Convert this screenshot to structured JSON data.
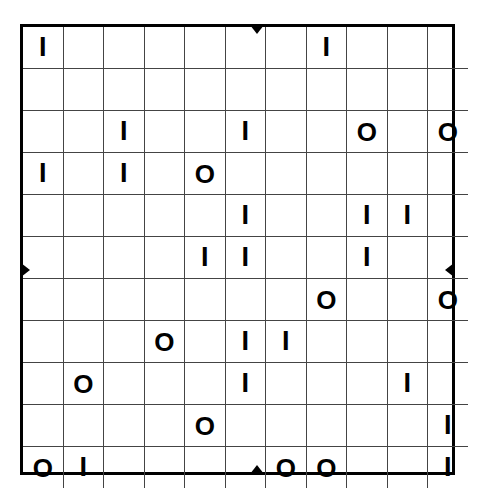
{
  "puzzle": {
    "title": "Binary Grid Puzzle",
    "grid": {
      "columns": 11,
      "rows": 11,
      "symbols": {
        "filled_i": "I",
        "filled_o": "O",
        "empty": ""
      },
      "border_color": "#000000",
      "line_color": "#444444",
      "background_color": "#ffffff",
      "cells": [
        [
          "I",
          "",
          "",
          "",
          "",
          "",
          "",
          "I",
          "",
          "",
          ""
        ],
        [
          "",
          "",
          "",
          "",
          "",
          "",
          "",
          "",
          "",
          "",
          ""
        ],
        [
          "",
          "",
          "I",
          "",
          "",
          "I",
          "",
          "",
          "O",
          "",
          "O"
        ],
        [
          "I",
          "",
          "I",
          "",
          "O",
          "",
          "",
          "",
          "",
          "",
          ""
        ],
        [
          "",
          "",
          "",
          "",
          "",
          "I",
          "",
          "",
          "I",
          "I",
          ""
        ],
        [
          "",
          "",
          "",
          "",
          "I",
          "I",
          "",
          "",
          "I",
          "",
          ""
        ],
        [
          "",
          "",
          "",
          "",
          "",
          "",
          "",
          "O",
          "",
          "",
          "O"
        ],
        [
          "",
          "",
          "",
          "O",
          "",
          "I",
          "I",
          "",
          "",
          "",
          ""
        ],
        [
          "",
          "O",
          "",
          "",
          "",
          "I",
          "",
          "",
          "",
          "I",
          ""
        ],
        [
          "",
          "",
          "",
          "",
          "O",
          "",
          "",
          "",
          "",
          "",
          "I"
        ],
        [
          "O",
          "I",
          "",
          "",
          "",
          "",
          "O",
          "O",
          "",
          "",
          "I"
        ]
      ]
    },
    "edge_markers": [
      {
        "name": "top-center-marker",
        "side": "top",
        "index": 5,
        "glyph": "triangle-down"
      },
      {
        "name": "bottom-center-marker",
        "side": "bottom",
        "index": 5,
        "glyph": "triangle-up"
      },
      {
        "name": "left-center-marker",
        "side": "left",
        "index": 5,
        "glyph": "triangle-right"
      },
      {
        "name": "right-center-marker",
        "side": "right",
        "index": 5,
        "glyph": "triangle-left"
      }
    ]
  }
}
